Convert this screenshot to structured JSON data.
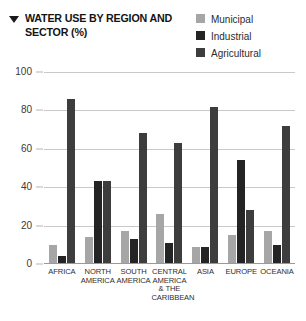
{
  "header": {
    "title": "WATER USE BY REGION AND SECTOR (%)",
    "bullet_icon": "triangle-down-icon"
  },
  "legend": {
    "position": "top-right",
    "items": [
      {
        "label": "Municipal",
        "color": "#a6a6a6"
      },
      {
        "label": "Industrial",
        "color": "#242424"
      },
      {
        "label": "Agricultural",
        "color": "#3d3d3d"
      }
    ]
  },
  "chart_data": {
    "type": "bar",
    "title": "WATER USE BY REGION AND SECTOR (%)",
    "xlabel": "",
    "ylabel": "",
    "ylim": [
      0,
      100
    ],
    "yticks": [
      0,
      20,
      40,
      60,
      80,
      100
    ],
    "grid": true,
    "legend_position": "top-right",
    "categories": [
      "AFRICA",
      "NORTH AMERICA",
      "SOUTH AMERICA",
      "CENTRAL AMERICA & THE CARIBBEAN",
      "ASIA",
      "EUROPE",
      "OCEANIA"
    ],
    "category_lines": [
      [
        "AFRICA"
      ],
      [
        "NORTH",
        "AMERICA"
      ],
      [
        "SOUTH",
        "AMERICA"
      ],
      [
        "CENTRAL",
        "AMERICA",
        "& THE",
        "CARIBBEAN"
      ],
      [
        "ASIA"
      ],
      [
        "EUROPE"
      ],
      [
        "OCEANIA"
      ]
    ],
    "series": [
      {
        "name": "Municipal",
        "color": "#a6a6a6",
        "values": [
          10,
          14,
          17,
          26,
          9,
          15,
          17
        ]
      },
      {
        "name": "Industrial",
        "color": "#242424",
        "values": [
          4,
          43,
          13,
          11,
          9,
          54,
          10
        ]
      },
      {
        "name": "Agricultural",
        "color": "#3d3d3d",
        "values": [
          86,
          43,
          68,
          63,
          82,
          28,
          72
        ]
      }
    ]
  }
}
